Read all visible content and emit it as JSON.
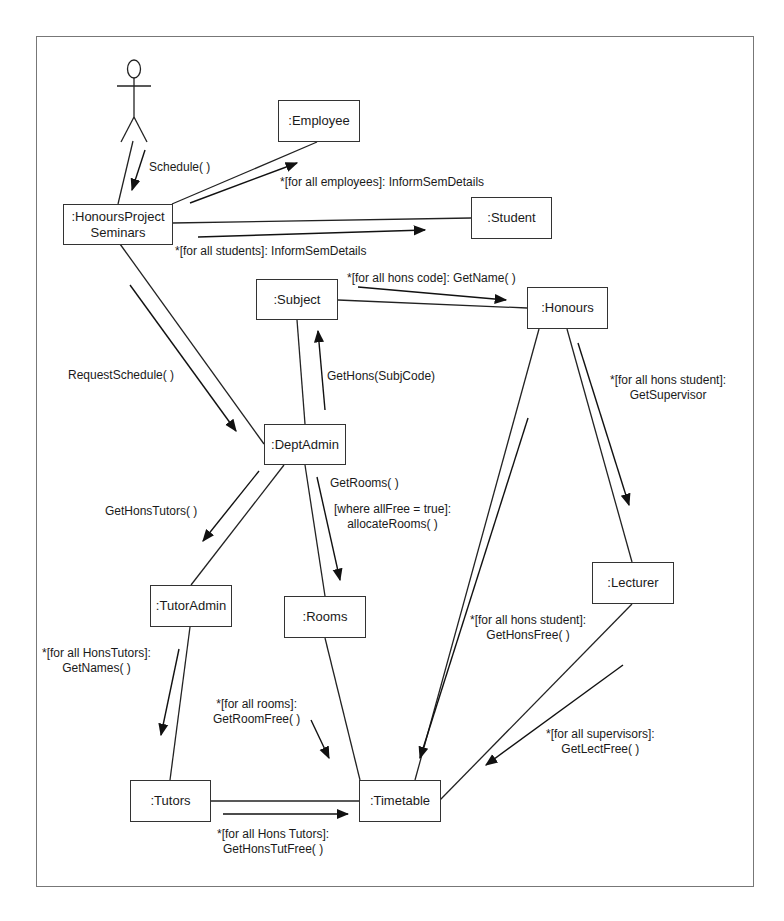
{
  "diagram": {
    "type": "UML collaboration diagram",
    "actor": {
      "name": "actor"
    },
    "objects": [
      {
        "id": "employee",
        "label": ":Employee"
      },
      {
        "id": "hps",
        "label": ":HonoursProject",
        "label2": "Seminars"
      },
      {
        "id": "student",
        "label": ":Student"
      },
      {
        "id": "subject",
        "label": ":Subject"
      },
      {
        "id": "honours",
        "label": ":Honours"
      },
      {
        "id": "deptadmin",
        "label": ":DeptAdmin"
      },
      {
        "id": "tutoradmin",
        "label": ":TutorAdmin"
      },
      {
        "id": "rooms",
        "label": ":Rooms"
      },
      {
        "id": "lecturer",
        "label": ":Lecturer"
      },
      {
        "id": "tutors",
        "label": ":Tutors"
      },
      {
        "id": "timetable",
        "label": ":Timetable"
      }
    ],
    "messages": [
      {
        "from": "actor",
        "to": "hps",
        "line1": "Schedule( )"
      },
      {
        "from": "hps",
        "to": "employee",
        "line1": "*[for all employees]: InformSemDetails"
      },
      {
        "from": "hps",
        "to": "student",
        "line1": "*[for all students]: InformSemDetails"
      },
      {
        "from": "hps",
        "to": "deptadmin",
        "line1": "RequestSchedule( )"
      },
      {
        "from": "subject",
        "to": "honours",
        "line1": "*[for all hons code]: GetName( )"
      },
      {
        "from": "deptadmin",
        "to": "subject",
        "line1": "GetHons(SubjCode)"
      },
      {
        "from": "honours",
        "to": "lecturer",
        "line1": "*[for all hons student]:",
        "line2": "GetSupervisor"
      },
      {
        "from": "deptadmin",
        "to": "tutoradmin",
        "line1": "GetHonsTutors( )"
      },
      {
        "from": "deptadmin",
        "to": "rooms",
        "line1": "GetRooms( )"
      },
      {
        "from": "deptadmin",
        "to": "rooms",
        "line1": "[where allFree = true]:",
        "line2": "allocateRooms( )"
      },
      {
        "from": "honours",
        "to": "timetable",
        "line1": "*[for all hons student]:",
        "line2": "GetHonsFree( )"
      },
      {
        "from": "tutoradmin",
        "to": "tutors",
        "line1": "*[for all HonsTutors]:",
        "line2": "GetNames( )"
      },
      {
        "from": "rooms",
        "to": "timetable",
        "line1": "*[for all rooms]:",
        "line2": "GetRoomFree( )"
      },
      {
        "from": "lecturer",
        "to": "timetable",
        "line1": "*[for all supervisors]:",
        "line2": "GetLectFree( )"
      },
      {
        "from": "tutors",
        "to": "timetable",
        "line1": "*[for all Hons Tutors]:",
        "line2": "GetHonsTutFree( )"
      }
    ]
  },
  "colors": {
    "line": "#222222",
    "frame": "#777777",
    "background": "#ffffff"
  }
}
